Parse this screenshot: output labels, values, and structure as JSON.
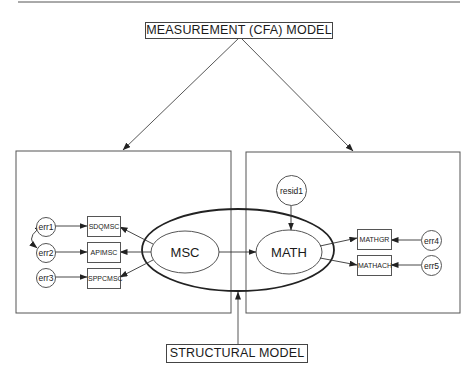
{
  "diagram": {
    "type": "SEM path diagram",
    "labels": {
      "measurement_model": "MEASUREMENT  (CFA)  MODEL",
      "structural_model": "STRUCTURAL MODEL"
    },
    "latent_variables": [
      {
        "id": "msc",
        "label": "MSC"
      },
      {
        "id": "math",
        "label": "MATH"
      }
    ],
    "observed_variables": {
      "msc_indicators": [
        {
          "label": "SDQMSC",
          "error": "err1"
        },
        {
          "label": "APIMSC",
          "error": "err2"
        },
        {
          "label": "SPPCMSC",
          "error": "err3"
        }
      ],
      "math_indicators": [
        {
          "label": "MATHGR",
          "error": "err4"
        },
        {
          "label": "MATHACH",
          "error": "err5"
        }
      ]
    },
    "residuals": [
      {
        "label": "resid1",
        "target": "MATH"
      }
    ],
    "paths": [
      {
        "from": "MSC",
        "to": "MATH"
      },
      {
        "from": "MSC",
        "to": "SDQMSC"
      },
      {
        "from": "MSC",
        "to": "APIMSC"
      },
      {
        "from": "MSC",
        "to": "SPPCMSC"
      },
      {
        "from": "MATH",
        "to": "MATHGR"
      },
      {
        "from": "MATH",
        "to": "MATHACH"
      },
      {
        "from": "err1",
        "to": "SDQMSC"
      },
      {
        "from": "err2",
        "to": "APIMSC"
      },
      {
        "from": "err3",
        "to": "SPPCMSC"
      },
      {
        "from": "err4",
        "to": "MATHGR"
      },
      {
        "from": "err5",
        "to": "MATHACH"
      },
      {
        "from": "resid1",
        "to": "MATH"
      }
    ],
    "covariances": [
      {
        "between": [
          "err1",
          "err2"
        ]
      }
    ]
  }
}
